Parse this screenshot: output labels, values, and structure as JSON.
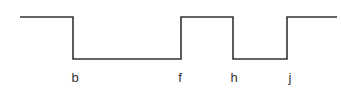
{
  "diagram": {
    "type": "square-waveform",
    "stroke_color": "#333333",
    "high_y": 17,
    "low_y": 59,
    "points": [
      [
        20,
        17
      ],
      [
        73,
        17
      ],
      [
        73,
        59
      ],
      [
        181,
        59
      ],
      [
        181,
        17
      ],
      [
        233,
        17
      ],
      [
        233,
        59
      ],
      [
        287,
        59
      ],
      [
        287,
        17
      ],
      [
        337,
        17
      ]
    ],
    "labels": [
      {
        "text": "b",
        "x": 75,
        "y": 82
      },
      {
        "text": "f",
        "x": 180,
        "y": 82
      },
      {
        "text": "h",
        "x": 234,
        "y": 82
      },
      {
        "text": "j",
        "x": 290,
        "y": 82
      }
    ]
  }
}
